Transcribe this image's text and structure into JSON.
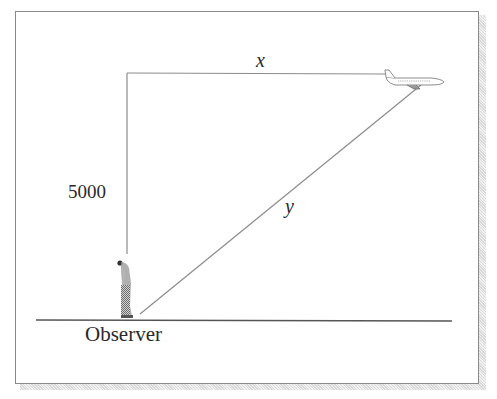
{
  "diagram": {
    "type": "related-rates airplane geometry",
    "labels": {
      "height": "5000",
      "horizontal_distance": "x",
      "line_of_sight": "y",
      "observer": "Observer"
    },
    "elements": {
      "airplane": "airplane-icon",
      "observer_figure": "person-icon",
      "ground": "ground-line"
    },
    "colors": {
      "line": "#8c8c8c",
      "ground": "#555555",
      "text": "#2a2a2a",
      "frame": "#8a8a8a"
    }
  }
}
